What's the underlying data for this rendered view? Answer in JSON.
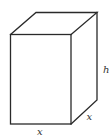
{
  "diagram": {
    "type": "rectangular-prism",
    "colors": {
      "stroke": "#2a2a2a",
      "label": "#333333",
      "background": "#ffffff"
    },
    "labels": {
      "bottom_width": "x",
      "depth": "x",
      "height": "h"
    },
    "vertices": {
      "front_top_left": [
        10.5,
        34.5
      ],
      "front_top_right": [
        71,
        34.5
      ],
      "front_bottom_left": [
        10.5,
        124
      ],
      "front_bottom_right": [
        71,
        124
      ],
      "back_top_left": [
        36,
        12.5
      ],
      "back_top_right": [
        97,
        12.5
      ],
      "back_bottom_right": [
        97,
        100
      ]
    }
  }
}
